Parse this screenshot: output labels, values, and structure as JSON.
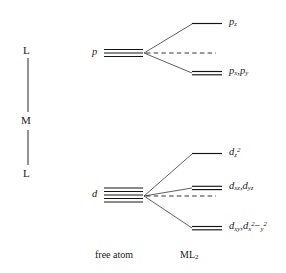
{
  "figure": {
    "type": "orbital-splitting-diagram"
  },
  "axis": {
    "name": "ligand-metal-ligand-axis",
    "top_label": "L",
    "middle_label": "M",
    "bottom_label": "L"
  },
  "free_atom": {
    "p": {
      "label": "p",
      "degeneracy": 3
    },
    "d": {
      "label": "d",
      "degeneracy": 5
    }
  },
  "columns": {
    "left_caption": "free atom",
    "right_caption_main": "ML",
    "right_caption_sub": "2"
  },
  "p_levels": [
    {
      "name": "p-z",
      "base": "p",
      "sub": "z",
      "sup": "",
      "degeneracy": 1,
      "energy_rank": "high"
    },
    {
      "name": "p-xy",
      "base": "p",
      "sub": "x",
      "sup": "",
      "degeneracy": 2,
      "energy_rank": "low",
      "full_text": "px,py"
    }
  ],
  "d_levels": [
    {
      "name": "d-z2",
      "base": "d",
      "sub": "z",
      "sup": "2",
      "degeneracy": 1,
      "energy_rank": "high"
    },
    {
      "name": "d-xz-yz",
      "base": "d",
      "degeneracy": 2,
      "energy_rank": "middle",
      "full_text": "dxz,dyz"
    },
    {
      "name": "d-xy-x2y2",
      "base": "d",
      "degeneracy": 2,
      "energy_rank": "low",
      "full_text": "dxy,dx2-y2"
    }
  ],
  "label_text": {
    "p_z_base": "p",
    "p_z_sub": "z",
    "p_xy_base1": "p",
    "p_xy_sub1": "x",
    "p_xy_comma": ",",
    "p_xy_base2": "p",
    "p_xy_sub2": "y",
    "d_z2_base": "d",
    "d_z2_sub": "z",
    "d_z2_sup": "2",
    "d_xz_base": "d",
    "d_xz_sub": "xz",
    "d_xz_comma": ",",
    "d_yz_base": "d",
    "d_yz_sub": "yz",
    "d_xy_base": "d",
    "d_xy_sub": "xy",
    "d_xy_comma": ",",
    "d_x2y2_base": "d",
    "d_x2y2_sub_x": "x",
    "d_x2y2_sup_2a": "2",
    "d_x2y2_minus": "−",
    "d_x2y2_sub_y": "y",
    "d_x2y2_sup_2b": "2"
  },
  "colors": {
    "line": "#1a1a1a",
    "text": "#1a1a1a",
    "background": "#ffffff",
    "dashed": "#2b2b2b",
    "axis": "#444444"
  }
}
